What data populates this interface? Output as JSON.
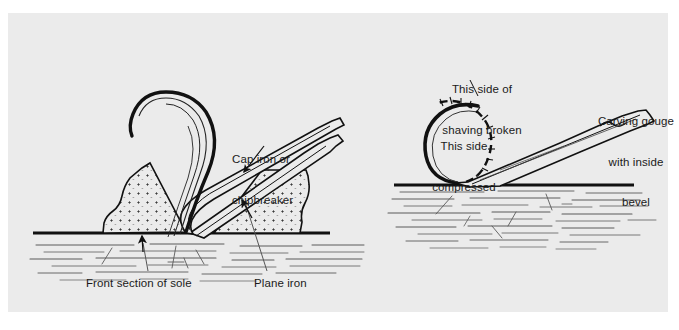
{
  "figure": {
    "type": "technical-line-diagram",
    "panel_background": "#ebebeb",
    "page_background": "#ffffff",
    "ink_color": "#111111",
    "grain_color": "#555555"
  },
  "labels": {
    "cap_iron": {
      "line1": "Cap iron or",
      "line2": "chipbreaker",
      "x": 232,
      "y": 126
    },
    "front_section_of_sole": {
      "text": "Front section of sole",
      "x": 86,
      "y": 277
    },
    "plane_iron": {
      "text": "Plane iron",
      "x": 254,
      "y": 277
    },
    "shaving_broken": {
      "line1": "This side of",
      "line2": "shaving broken",
      "x": 430,
      "y": 56
    },
    "shaving_compressed": {
      "line1": "This side",
      "line2": "compressed",
      "x": 424,
      "y": 113
    },
    "carving_gouge": {
      "line1": "Carving gouge",
      "line2": "with inside",
      "line3": "bevel",
      "x": 593,
      "y": 88
    }
  },
  "left_scene": {
    "name": "bench-plane-cutting-shaving",
    "parts": [
      "front-section-of-sole",
      "plane-iron",
      "cap-iron-chipbreaker",
      "curled-shaving",
      "workpiece-wood-grain",
      "baseline-surface"
    ]
  },
  "right_scene": {
    "name": "carving-gouge-cutting-shaving",
    "parts": [
      "carving-gouge-blade",
      "inside-bevel",
      "tightly-curled-shaving",
      "broken-outer-face-dashed",
      "compressed-inner-face",
      "workpiece-wood-grain",
      "baseline-surface"
    ]
  }
}
